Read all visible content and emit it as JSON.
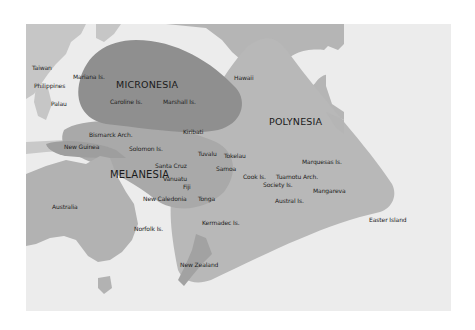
{
  "map": {
    "regions": [
      {
        "name": "MICRONESIA",
        "color": "#8f8f8f"
      },
      {
        "name": "POLYNESIA",
        "color": "#b8b8b8"
      },
      {
        "name": "MELANESIA",
        "color": "#a9a9a9"
      }
    ],
    "colors": {
      "ocean": "#ececec",
      "land": "#b2b2b2"
    },
    "labels": {
      "taiwan": "Taiwan",
      "philippines": "Philippines",
      "palau": "Palau",
      "mariana": "Mariana Is.",
      "caroline": "Caroline Is.",
      "marshall": "Marshall Is.",
      "kiribati": "Kiribati",
      "hawaii": "Hawaii",
      "bismarck": "Bismarck Arch.",
      "new_guinea": "New Guinea",
      "solomon": "Solomon Is.",
      "tuvalu": "Tuvalu",
      "tokelau": "Tokelau",
      "marquesas": "Marquesas Is.",
      "santa_cruz": "Santa Cruz",
      "samoa": "Samoa",
      "vanuatu": "Vanuatu",
      "cook": "Cook Is.",
      "tuamotu": "Tuamotu Arch.",
      "society": "Society Is.",
      "fiji": "Fiji",
      "mangareva": "Mangareva",
      "australia": "Australia",
      "new_caledonia": "New Caledonia",
      "tonga": "Tonga",
      "austral": "Austral Is.",
      "easter": "Easter Island",
      "kermadec": "Kermadec Is.",
      "norfolk": "Norfolk Is.",
      "new_zealand": "New Zealand"
    }
  }
}
